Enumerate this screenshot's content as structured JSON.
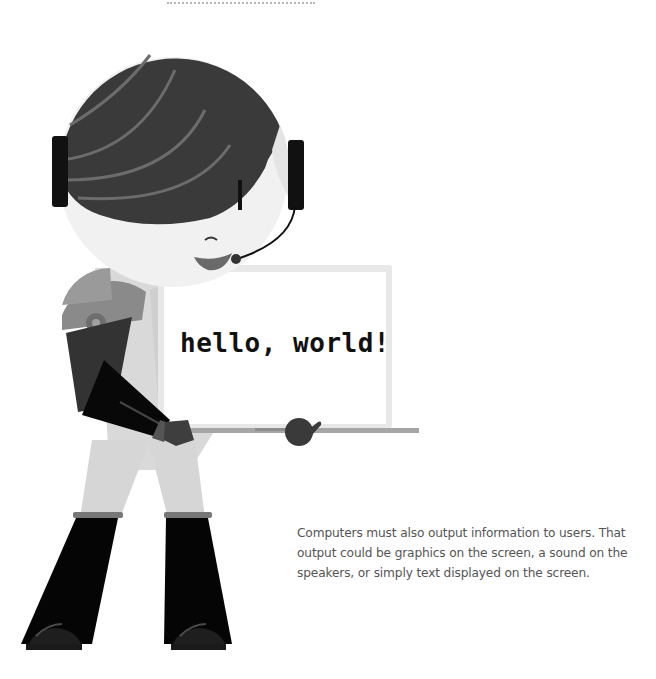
{
  "screen": {
    "text": "hello, world!"
  },
  "caption": {
    "text": "Computers must also output information to users. That output could be graphics on the screen, a sound on the speakers, or simply text displayed on the screen."
  },
  "colors": {
    "background": "#ffffff",
    "hair": "#3a3a3a",
    "hair_streak": "#6e6e6e",
    "face": "#f2f2f2",
    "headphones": "#111111",
    "shoulder": "#8a8a8a",
    "upper_arm": "#333333",
    "forearm": "#0a0a0a",
    "body": "#d8d8d8",
    "legs": "#d4d4d4",
    "boots": "#050505",
    "board": "#ffffff",
    "board_frame": "#e6e6e6",
    "base_bar": "#a8a8a8",
    "hand": "#3a3a3a",
    "caption_text": "#555555"
  },
  "icons": {
    "decorative_rule": "dotted-rule",
    "character": "person-with-headset-illustration",
    "laptop": "laptop-screen-illustration"
  }
}
